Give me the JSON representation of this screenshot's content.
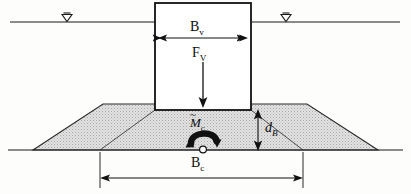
{
  "figure": {
    "colors": {
      "line": "#1a1a1a",
      "fill_soil": "#d9d9d9",
      "fill_box": "#ffffff",
      "background": "#fdfdfb",
      "arrow": "#111111"
    },
    "labels": {
      "box_width": "B",
      "box_width_sub": "v",
      "vertical_force": "F",
      "vertical_force_sub": "V",
      "moment": "M",
      "moment_sub": "c",
      "moment_accent": "~",
      "embedment_depth": "d",
      "embedment_depth_sub": "B",
      "base_width": "B",
      "base_width_sub": "c"
    },
    "symbols": {
      "water_table_left": "water-table-triangle",
      "water_table_right": "water-table-triangle",
      "moment_arrow": "curved-moment-arrow",
      "pivot": "pivot-circle"
    },
    "geometry": {
      "box": {
        "x": 155,
        "y": 3,
        "w": 96,
        "h": 107
      },
      "water_line_y": 22,
      "water_line_left": {
        "x1": 10,
        "x2": 155
      },
      "water_line_right": {
        "x1": 251,
        "x2": 400
      },
      "ground_line_y": 150,
      "berm_top_y": 104,
      "berm_top_left_x": 103,
      "berm_top_right_x": 307,
      "berm_base_left_x": 33,
      "berm_base_right_x": 378,
      "base_dim_left_x": 100,
      "base_dim_right_x": 303,
      "base_dim_y": 178,
      "width_dim_y": 38,
      "depth_dim_x": 258
    }
  }
}
